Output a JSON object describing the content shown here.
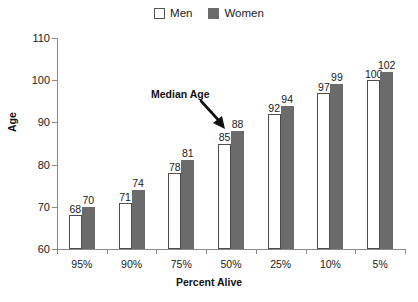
{
  "legend": {
    "entries": [
      {
        "label": "Men",
        "swatch": "open-square-icon",
        "color": "#ffffff"
      },
      {
        "label": "Women",
        "swatch": "filled-square-icon",
        "color": "#6b6b6b"
      }
    ]
  },
  "annotation": {
    "text": "Median Age",
    "arrow_icon": "down-right-arrow-icon",
    "points_to": "50% Women bar (88)"
  },
  "colors": {
    "men_bar_fill": "#ffffff",
    "men_bar_stroke": "#4d4d4d",
    "women_bar_fill": "#6b6b6b",
    "axis": "#8a8a8a",
    "text": "#1a1a1a",
    "background": "#ffffff"
  },
  "chart_data": {
    "type": "bar",
    "title": "",
    "xlabel": "Percent Alive",
    "ylabel": "Age",
    "categories": [
      "95%",
      "90%",
      "75%",
      "50%",
      "25%",
      "10%",
      "5%"
    ],
    "series": [
      {
        "name": "Men",
        "values": [
          68,
          71,
          78,
          85,
          92,
          97,
          100
        ]
      },
      {
        "name": "Women",
        "values": [
          70,
          74,
          81,
          88,
          94,
          99,
          102
        ]
      }
    ],
    "ylim": [
      60,
      110
    ],
    "yticks": [
      60,
      70,
      80,
      90,
      100,
      110
    ],
    "ytick_labels": [
      "60",
      "70",
      "80",
      "90",
      "100",
      "110"
    ],
    "grid": false,
    "legend_position": "top-center",
    "data_labels": true,
    "annotations": [
      {
        "text": "Median Age",
        "target_series": "Women",
        "target_category": "50%",
        "target_value": 88
      }
    ]
  }
}
